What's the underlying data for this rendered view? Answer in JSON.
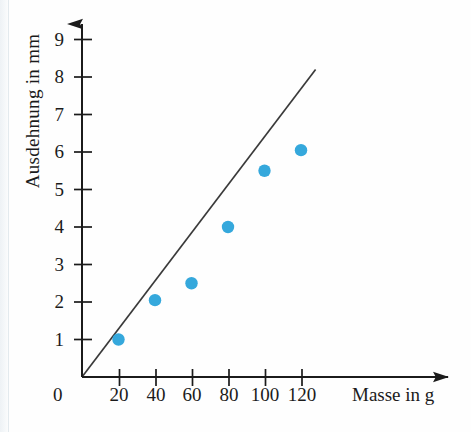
{
  "chart_data": {
    "type": "scatter",
    "title": "",
    "subtitle": "",
    "xlabel": "Masse in g",
    "ylabel": "Ausdehnung in mm",
    "xlim": [
      0,
      130
    ],
    "ylim": [
      0,
      9.4
    ],
    "grid": false,
    "legend": null,
    "x_ticks": [
      20,
      40,
      60,
      80,
      100,
      120
    ],
    "x_tick_labels": [
      "20",
      "40",
      "60",
      "80",
      "100",
      "120"
    ],
    "y_ticks": [
      1,
      2,
      3,
      4,
      5,
      6,
      7,
      8,
      9
    ],
    "y_tick_labels": [
      "1",
      "2",
      "3",
      "4",
      "5",
      "6",
      "7",
      "8",
      "9"
    ],
    "origin_label": "0",
    "point_color": "#35a8dc",
    "line_color": "#3a3a3a",
    "axis_color": "#1b1b1b",
    "series": [
      {
        "name": "Messpunkte",
        "marker": "circle",
        "x": [
          20,
          40,
          60,
          80,
          100,
          120
        ],
        "y": [
          1.0,
          2.05,
          2.5,
          4.0,
          5.5,
          6.05
        ]
      },
      {
        "name": "Ausgleichsgerade",
        "type": "line",
        "x": [
          0,
          128
        ],
        "y": [
          0,
          8.2
        ]
      }
    ]
  },
  "axes": {
    "x_axis_name": "Masse in g",
    "y_axis_name": "Ausdehnung in mm",
    "x_arrow": true,
    "y_arrow": true
  }
}
